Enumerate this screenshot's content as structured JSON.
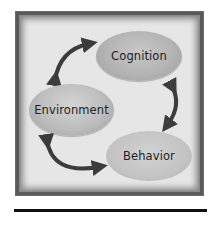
{
  "diagram": {
    "nodes": [
      {
        "id": "cognition",
        "label": "Cognition"
      },
      {
        "id": "environment",
        "label": "Environment"
      },
      {
        "id": "behavior",
        "label": "Behavior"
      }
    ],
    "edges": [
      {
        "from": "environment",
        "to": "cognition",
        "bidirectional": true
      },
      {
        "from": "cognition",
        "to": "behavior",
        "bidirectional": true
      },
      {
        "from": "behavior",
        "to": "environment",
        "bidirectional": true
      }
    ],
    "colors": {
      "frame": "#5a5a5a",
      "panel": "#ececec",
      "arrow": "#3c3c3c",
      "node": "#b8b8b8",
      "text": "#222222"
    }
  }
}
